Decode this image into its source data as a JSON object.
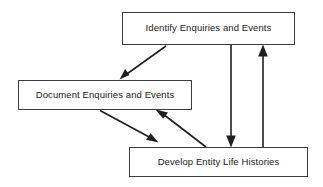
{
  "diagram": {
    "background_color": "#ffffff",
    "border_color": "#3b3b3b",
    "line_color": "#1f1f1f",
    "text_color": "#1a1a1a",
    "nodes": [
      {
        "id": "identify",
        "label": "Identify Enquiries and Events",
        "x": 122,
        "y": 12,
        "width": 173,
        "height": 33
      },
      {
        "id": "document",
        "label": "Document Enquiries and Events",
        "x": 18,
        "y": 80,
        "width": 174,
        "height": 30
      },
      {
        "id": "develop",
        "label": "Develop Entity Life Histories",
        "x": 129,
        "y": 147,
        "width": 179,
        "height": 30
      }
    ],
    "edges": [
      {
        "id": "identify-to-document",
        "from": "identify",
        "to": "document",
        "label": "",
        "direction": "down-left"
      },
      {
        "id": "identify-to-develop",
        "from": "identify",
        "to": "develop",
        "label": "",
        "direction": "down"
      },
      {
        "id": "develop-to-identify",
        "from": "develop",
        "to": "identify",
        "label": "",
        "direction": "up"
      },
      {
        "id": "document-to-develop",
        "from": "document",
        "to": "develop",
        "label": "",
        "direction": "down-right"
      },
      {
        "id": "develop-to-document",
        "from": "develop",
        "to": "document",
        "label": "",
        "direction": "up-left"
      }
    ]
  }
}
